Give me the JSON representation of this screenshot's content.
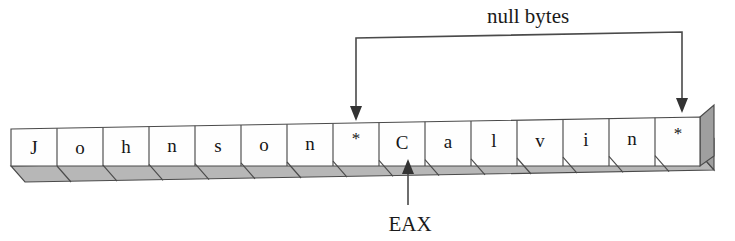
{
  "diagram": {
    "title": "null bytes",
    "byte_array": {
      "cells": [
        {
          "index": 0,
          "char": "J",
          "kind": "char"
        },
        {
          "index": 1,
          "char": "o",
          "kind": "char"
        },
        {
          "index": 2,
          "char": "h",
          "kind": "char"
        },
        {
          "index": 3,
          "char": "n",
          "kind": "char"
        },
        {
          "index": 4,
          "char": "s",
          "kind": "char"
        },
        {
          "index": 5,
          "char": "o",
          "kind": "char"
        },
        {
          "index": 6,
          "char": "n",
          "kind": "char"
        },
        {
          "index": 7,
          "char": "*",
          "kind": "null"
        },
        {
          "index": 8,
          "char": "C",
          "kind": "char"
        },
        {
          "index": 9,
          "char": "a",
          "kind": "char"
        },
        {
          "index": 10,
          "char": "l",
          "kind": "char"
        },
        {
          "index": 11,
          "char": "v",
          "kind": "char"
        },
        {
          "index": 12,
          "char": "i",
          "kind": "char"
        },
        {
          "index": 13,
          "char": "n",
          "kind": "char"
        },
        {
          "index": 14,
          "char": "*",
          "kind": "null"
        }
      ]
    },
    "annotations": {
      "null_bytes_label": "null bytes",
      "register_label": "EAX"
    },
    "colors": {
      "face": "#fefefe",
      "outline": "#4a4a4a",
      "bottom_shade": "#b7b7b7",
      "side_shade": "#9f9f9f",
      "text": "#161616",
      "leader": "#4a4a4a"
    }
  }
}
